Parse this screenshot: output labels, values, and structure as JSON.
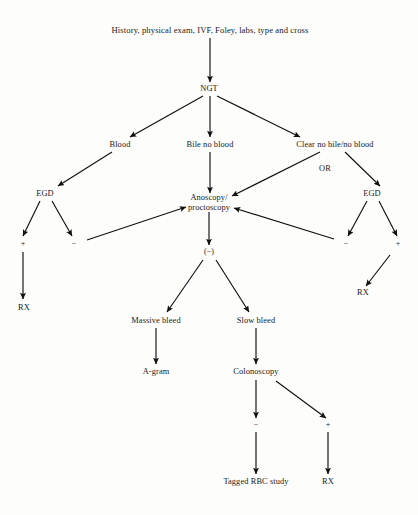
{
  "diagram": {
    "stroke_color": "#111111",
    "text_color": "#1a1a1a",
    "background_color": "#fdfdfc",
    "nodes": [
      {
        "id": "initial",
        "label": "History, physical exam, IVF, Foley, labs, type and cross",
        "x": 210,
        "y": 30,
        "kind": "step"
      },
      {
        "id": "ngt",
        "label": "NGT",
        "x": 209,
        "y": 89,
        "kind": "step"
      },
      {
        "id": "blood",
        "label": "Blood",
        "x": 120,
        "y": 145,
        "kind": "outcome"
      },
      {
        "id": "bile",
        "label": "Bile no blood",
        "x": 210,
        "y": 145,
        "kind": "outcome"
      },
      {
        "id": "clear",
        "label": "Clear no bile/no blood",
        "x": 335,
        "y": 145,
        "kind": "outcome"
      },
      {
        "id": "or",
        "label": "OR",
        "x": 325,
        "y": 169,
        "kind": "connector"
      },
      {
        "id": "egd_left",
        "label": "EGD",
        "x": 45,
        "y": 194,
        "kind": "step"
      },
      {
        "id": "anoscopy",
        "label": "Anoscopy/\nproctoscopy",
        "x": 209,
        "y": 203,
        "kind": "step"
      },
      {
        "id": "egd_right",
        "label": "EGD",
        "x": 372,
        "y": 194,
        "kind": "step"
      },
      {
        "id": "egdl_pos",
        "label": "+",
        "x": 23,
        "y": 244,
        "kind": "sign"
      },
      {
        "id": "egdl_neg",
        "label": "−",
        "x": 74,
        "y": 244,
        "kind": "sign"
      },
      {
        "id": "egdr_neg",
        "label": "−",
        "x": 346,
        "y": 244,
        "kind": "sign"
      },
      {
        "id": "egdr_pos",
        "label": "+",
        "x": 398,
        "y": 244,
        "kind": "sign"
      },
      {
        "id": "ano_neg",
        "label": "(−)",
        "x": 209,
        "y": 252,
        "kind": "sign"
      },
      {
        "id": "rx_left",
        "label": "RX",
        "x": 24,
        "y": 308,
        "kind": "terminal"
      },
      {
        "id": "rx_right",
        "label": "RX",
        "x": 363,
        "y": 293,
        "kind": "terminal"
      },
      {
        "id": "massive",
        "label": "Massive bleed",
        "x": 156,
        "y": 321,
        "kind": "outcome"
      },
      {
        "id": "slow",
        "label": "Slow bleed",
        "x": 256,
        "y": 321,
        "kind": "outcome"
      },
      {
        "id": "agram",
        "label": "A-gram",
        "x": 156,
        "y": 372,
        "kind": "terminal"
      },
      {
        "id": "colonoscopy",
        "label": "Colonoscopy",
        "x": 256,
        "y": 372,
        "kind": "step"
      },
      {
        "id": "colo_neg",
        "label": "−",
        "x": 256,
        "y": 425,
        "kind": "sign"
      },
      {
        "id": "colo_pos",
        "label": "+",
        "x": 328,
        "y": 425,
        "kind": "sign"
      },
      {
        "id": "tagged",
        "label": "Tagged RBC study",
        "x": 256,
        "y": 482,
        "kind": "terminal"
      },
      {
        "id": "rx_bottom",
        "label": "RX",
        "x": 328,
        "y": 482,
        "kind": "terminal"
      }
    ],
    "edges": [
      {
        "from": "initial",
        "to": "ngt",
        "x1": 210,
        "y1": 38,
        "x2": 210,
        "y2": 82
      },
      {
        "from": "ngt",
        "to": "blood",
        "x1": 203,
        "y1": 96,
        "x2": 130,
        "y2": 137
      },
      {
        "from": "ngt",
        "to": "bile",
        "x1": 210,
        "y1": 96,
        "x2": 210,
        "y2": 137
      },
      {
        "from": "ngt",
        "to": "clear",
        "x1": 217,
        "y1": 96,
        "x2": 300,
        "y2": 137
      },
      {
        "from": "blood",
        "to": "egd_left",
        "x1": 112,
        "y1": 152,
        "x2": 58,
        "y2": 186
      },
      {
        "from": "bile",
        "to": "anoscopy",
        "x1": 210,
        "y1": 152,
        "x2": 210,
        "y2": 193
      },
      {
        "from": "clear",
        "to": "anoscopy",
        "x1": 320,
        "y1": 152,
        "x2": 232,
        "y2": 196
      },
      {
        "from": "clear",
        "to": "egd_right",
        "x1": 345,
        "y1": 152,
        "x2": 380,
        "y2": 186
      },
      {
        "from": "egd_left",
        "to": "egdl_pos",
        "x1": 40,
        "y1": 201,
        "x2": 23,
        "y2": 236
      },
      {
        "from": "egd_left",
        "to": "egdl_neg",
        "x1": 52,
        "y1": 201,
        "x2": 72,
        "y2": 236
      },
      {
        "from": "egdl_neg",
        "to": "anoscopy",
        "x1": 87,
        "y1": 240,
        "x2": 186,
        "y2": 207
      },
      {
        "from": "egdl_pos",
        "to": "rx_left",
        "x1": 23,
        "y1": 252,
        "x2": 23,
        "y2": 299
      },
      {
        "from": "egd_right",
        "to": "egdr_neg",
        "x1": 367,
        "y1": 201,
        "x2": 348,
        "y2": 236
      },
      {
        "from": "egd_right",
        "to": "egdr_pos",
        "x1": 379,
        "y1": 201,
        "x2": 397,
        "y2": 236
      },
      {
        "from": "egdr_neg",
        "to": "anoscopy",
        "x1": 334,
        "y1": 239,
        "x2": 234,
        "y2": 208
      },
      {
        "from": "egdr_pos",
        "to": "rx_right",
        "x1": 390,
        "y1": 255,
        "x2": 366,
        "y2": 286
      },
      {
        "from": "anoscopy",
        "to": "ano_neg",
        "x1": 209,
        "y1": 212,
        "x2": 209,
        "y2": 245
      },
      {
        "from": "ano_neg",
        "to": "massive",
        "x1": 203,
        "y1": 260,
        "x2": 167,
        "y2": 312
      },
      {
        "from": "ano_neg",
        "to": "slow",
        "x1": 216,
        "y1": 260,
        "x2": 249,
        "y2": 312
      },
      {
        "from": "massive",
        "to": "agram",
        "x1": 156,
        "y1": 328,
        "x2": 156,
        "y2": 364
      },
      {
        "from": "slow",
        "to": "colonoscopy",
        "x1": 256,
        "y1": 328,
        "x2": 256,
        "y2": 364
      },
      {
        "from": "colonoscopy",
        "to": "colo_neg",
        "x1": 256,
        "y1": 380,
        "x2": 256,
        "y2": 418
      },
      {
        "from": "colonoscopy",
        "to": "colo_pos",
        "x1": 276,
        "y1": 381,
        "x2": 326,
        "y2": 418
      },
      {
        "from": "colo_neg",
        "to": "tagged",
        "x1": 256,
        "y1": 432,
        "x2": 256,
        "y2": 474
      },
      {
        "from": "colo_pos",
        "to": "rx_bottom",
        "x1": 328,
        "y1": 432,
        "x2": 328,
        "y2": 474
      }
    ]
  }
}
